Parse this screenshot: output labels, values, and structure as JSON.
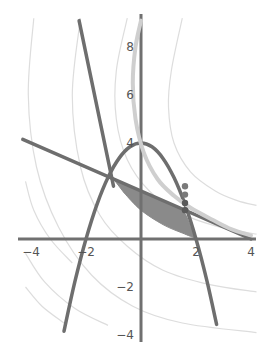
{
  "chart_data": {
    "type": "line",
    "title": "",
    "xlabel": "",
    "ylabel": "",
    "xlim": [
      -4.2,
      4.2
    ],
    "ylim": [
      -4,
      9.2
    ],
    "grid": false,
    "x_ticks": [
      {
        "value": -4,
        "label": "-4"
      },
      {
        "value": -2,
        "label": "-2"
      },
      {
        "value": 2,
        "label": "2"
      },
      {
        "value": 4,
        "label": "4"
      }
    ],
    "y_ticks": [
      {
        "value": -4,
        "label": "-4"
      },
      {
        "value": -2,
        "label": "-2"
      },
      {
        "value": 4,
        "label": "4"
      },
      {
        "value": 6,
        "label": "6"
      },
      {
        "value": 8,
        "label": "8"
      }
    ],
    "series": [
      {
        "name": "parabola",
        "description": "y = 4 - x^2",
        "color": "#6e6e6e",
        "points": [
          [
            -2.8,
            -3.84
          ],
          [
            -2.4,
            -1.76
          ],
          [
            -2.0,
            0
          ],
          [
            -1.6,
            1.44
          ],
          [
            -1.2,
            2.56
          ],
          [
            -0.8,
            3.36
          ],
          [
            -0.4,
            3.84
          ],
          [
            0,
            4
          ],
          [
            0.4,
            3.84
          ],
          [
            0.8,
            3.36
          ],
          [
            1.2,
            2.56
          ],
          [
            1.6,
            1.44
          ],
          [
            2.0,
            0
          ],
          [
            2.4,
            -1.76
          ],
          [
            2.75,
            -3.56
          ]
        ]
      },
      {
        "name": "steep-line",
        "description": "steep descending line",
        "color": "#6e6e6e",
        "points": [
          [
            -2.25,
            9.1
          ],
          [
            -1.0,
            2.2
          ]
        ]
      },
      {
        "name": "shallow-line",
        "description": "y = 2 - x/2",
        "color": "#6e6e6e",
        "points": [
          [
            -4.3,
            4.15
          ],
          [
            4.0,
            0.0
          ]
        ]
      },
      {
        "name": "light-curve",
        "description": "decreasing convex curve",
        "color": "#cfcfcf",
        "points": [
          [
            0.0,
            9.1
          ],
          [
            -0.2,
            8.0
          ],
          [
            -0.3,
            6.5
          ],
          [
            -0.2,
            5.0
          ],
          [
            0.1,
            3.6
          ],
          [
            0.6,
            2.5
          ],
          [
            1.2,
            1.8
          ],
          [
            1.8,
            1.3
          ],
          [
            2.6,
            0.8
          ],
          [
            3.3,
            0.4
          ],
          [
            4.0,
            0.15
          ]
        ]
      }
    ],
    "shaded_region": {
      "color": "#8a8a8a",
      "points": [
        [
          -1.0,
          2.5
        ],
        [
          -0.3,
          2.15
        ],
        [
          0.5,
          1.75
        ],
        [
          1.2,
          1.4
        ],
        [
          1.6,
          1.05
        ],
        [
          1.85,
          0.35
        ],
        [
          2.0,
          0.05
        ],
        [
          1.5,
          0.25
        ],
        [
          0.8,
          0.6
        ],
        [
          0.0,
          1.2
        ],
        [
          -0.6,
          1.9
        ]
      ]
    },
    "markers": [
      {
        "x": 1.6,
        "y": 2.2,
        "color": "#7a7a7a"
      },
      {
        "x": 1.6,
        "y": 1.85,
        "color": "#7a7a7a"
      },
      {
        "x": 1.6,
        "y": 1.5,
        "color": "#5a5a5a"
      },
      {
        "x": 1.6,
        "y": 1.2,
        "color": "#5a5a5a"
      }
    ],
    "contours": [
      {
        "color": "#dddddd",
        "points": [
          [
            -3.9,
            9.2
          ],
          [
            -4.1,
            6
          ],
          [
            -3.8,
            3
          ],
          [
            -3.0,
            0.5
          ],
          [
            -1.8,
            -1.5
          ],
          [
            -0.3,
            -2.8
          ],
          [
            1.5,
            -3.5
          ],
          [
            4.2,
            -3.9
          ]
        ]
      },
      {
        "color": "#dddddd",
        "points": [
          [
            -2.2,
            9.2
          ],
          [
            -2.5,
            6
          ],
          [
            -2.2,
            3
          ],
          [
            -1.5,
            1
          ],
          [
            -0.5,
            -0.3
          ],
          [
            0.8,
            -1.3
          ],
          [
            2.5,
            -1.9
          ],
          [
            4.2,
            -2.2
          ]
        ]
      },
      {
        "color": "#dddddd",
        "points": [
          [
            -0.5,
            9.2
          ],
          [
            -0.9,
            7
          ],
          [
            -0.9,
            5
          ],
          [
            -0.5,
            3.3
          ],
          [
            0.3,
            2.0
          ],
          [
            1.4,
            1.1
          ],
          [
            2.7,
            0.55
          ],
          [
            4.2,
            0.2
          ]
        ]
      },
      {
        "color": "#dddddd",
        "points": [
          [
            1.5,
            9.2
          ],
          [
            1.1,
            7
          ],
          [
            1.0,
            5.5
          ],
          [
            1.2,
            4
          ],
          [
            1.8,
            2.8
          ],
          [
            2.7,
            2.0
          ],
          [
            3.5,
            1.6
          ],
          [
            4.2,
            1.4
          ]
        ]
      },
      {
        "color": "#dddddd",
        "points": [
          [
            -4.2,
            -0.6
          ],
          [
            -3.5,
            -1.8
          ],
          [
            -2.4,
            -2.9
          ],
          [
            -1.2,
            -3.6
          ]
        ]
      },
      {
        "color": "#dddddd",
        "points": [
          [
            -4.2,
            -2.0
          ],
          [
            -3.6,
            -2.8
          ],
          [
            -2.8,
            -3.5
          ]
        ]
      },
      {
        "color": "#dddddd",
        "points": [
          [
            -4.2,
            2.4
          ],
          [
            -3.9,
            1.2
          ],
          [
            -3.3,
            0.0
          ],
          [
            -2.5,
            -1.0
          ]
        ]
      }
    ]
  }
}
